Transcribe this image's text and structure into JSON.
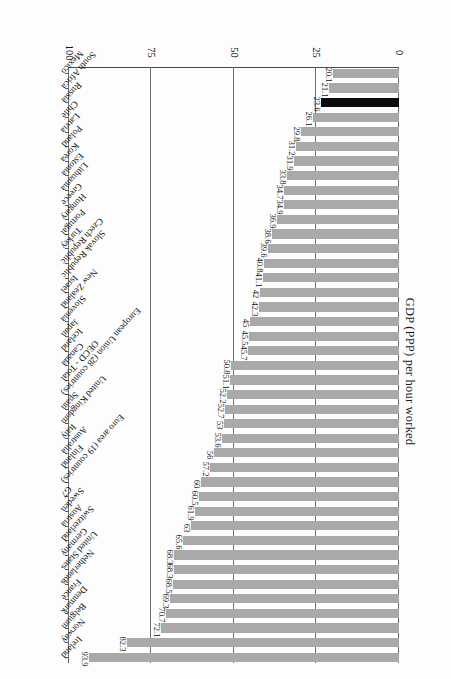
{
  "chart_data": {
    "type": "bar",
    "orientation": "horizontal",
    "title": "",
    "xlabel": "",
    "ylabel": "GDP (PPP) per hour worked",
    "axis_title": "GDP (PPP) per hour worked",
    "ylim": [
      0,
      100
    ],
    "ticks": [
      "0",
      "25",
      "50",
      "75",
      "100"
    ],
    "tick_values": [
      0,
      25,
      50,
      75,
      100
    ],
    "grid": true,
    "legend": "none",
    "highlight_color": "#0b0b0b",
    "bar_color": "#a9a9a9",
    "highlight_category": "Russia",
    "categories": [
      "Ireland",
      "Norway",
      "Belgium",
      "Denmark",
      "France",
      "Netherlands",
      "United States",
      "Germany",
      "Switzerland",
      "Austria",
      "Sweden",
      "G7",
      "Euro area (19 countries)",
      "Finland",
      "Australia",
      "Italy",
      "United Kingdom",
      "Spain",
      "European Union (28 countries)",
      "OECD - Total",
      "Canada",
      "Iceland",
      "Japan",
      "Slovenia",
      "New Zealand",
      "Israel",
      "Slovak Republic",
      "Czech Republic",
      "Turkey",
      "Portugal",
      "Hungary",
      "Greece",
      "Lithuania",
      "Estonia",
      "Korea",
      "Poland",
      "Latvia",
      "Chile",
      "Russia",
      "South Africa",
      "Mexico"
    ],
    "values": [
      93.9,
      82.3,
      72.1,
      70.7,
      69.3,
      68.5,
      68.3,
      68.3,
      65.6,
      63,
      61.9,
      60.5,
      60,
      57.2,
      56,
      53.6,
      53,
      52.7,
      52.2,
      51.1,
      50.8,
      45.7,
      45.5,
      45,
      42.3,
      42,
      41.1,
      40.8,
      39.6,
      38.6,
      36.9,
      34.9,
      34.7,
      33.8,
      31.9,
      31.2,
      29.8,
      26.1,
      23.6,
      21.1,
      20.1
    ],
    "value_labels": [
      "93.9",
      "82.3",
      "72.1",
      "70.7",
      "69.3",
      "68.5",
      "68.3",
      "68.3",
      "65.6",
      "63",
      "61.9",
      "60.5",
      "60",
      "57.2",
      "56",
      "53.6",
      "53",
      "52.7",
      "52.2",
      "51.1",
      "50.8",
      "45.7",
      "45.5",
      "45",
      "42.3",
      "42",
      "41.1",
      "40.8",
      "39.6",
      "38.6",
      "36.9",
      "34.9",
      "34.7",
      "33.8",
      "31.9",
      "31.2",
      "29.8",
      "26.1",
      "23.6",
      "21.1",
      "20.1"
    ]
  }
}
